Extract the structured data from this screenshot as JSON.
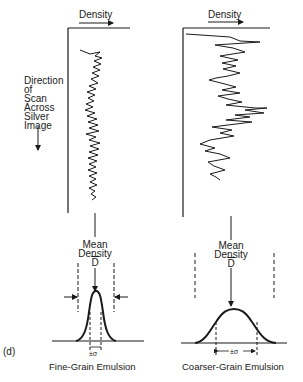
{
  "figure": {
    "panel_label": "(d)",
    "left_panel": {
      "axis_label": "Density",
      "scan_direction_label": [
        "Direction",
        "of",
        "Scan",
        "Across",
        "Silver",
        "Image"
      ],
      "mean_label": [
        "Mean",
        "Density"
      ],
      "mean_symbol": "D",
      "sigma_label": "±σ",
      "caption": "Fine-Grain Emulsion"
    },
    "right_panel": {
      "axis_label": "Density",
      "mean_label": [
        "Mean",
        "Density"
      ],
      "mean_symbol": "D",
      "sigma_label": "±σ",
      "caption": "Coarser-Grain Emulsion"
    }
  }
}
